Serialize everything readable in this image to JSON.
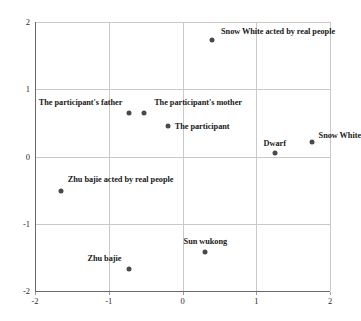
{
  "chart_data": {
    "type": "scatter",
    "title": "",
    "subtitle": "",
    "xlabel": "",
    "ylabel": "",
    "xlim": [
      -2,
      2
    ],
    "ylim": [
      -2,
      2
    ],
    "xticks": [
      "-2",
      "-1",
      "0",
      "1",
      "2"
    ],
    "xtick_values": [
      -2,
      -1,
      0,
      1,
      2
    ],
    "yticks": [
      "2",
      "1",
      "0",
      "-1",
      "-2"
    ],
    "ytick_values": [
      2,
      1,
      0,
      -1,
      -2
    ],
    "grid": true,
    "legend": "none",
    "marker_color": "#4a4a4a",
    "grid_color": "#c9c9c9",
    "axis_color": "#6a6a6a",
    "points": [
      {
        "label": "Snow White acted by real people",
        "x": 0.4,
        "y": 1.73,
        "label_anchor": "left",
        "label_dx": 9,
        "label_dy": -9
      },
      {
        "label": "The participant's father",
        "x": -0.72,
        "y": 0.65,
        "label_anchor": "right",
        "label_dx": -7,
        "label_dy": -11
      },
      {
        "label": "The participant's mother",
        "x": -0.52,
        "y": 0.65,
        "label_anchor": "left",
        "label_dx": 10,
        "label_dy": -11
      },
      {
        "label": "The participant",
        "x": -0.2,
        "y": 0.46,
        "label_anchor": "left",
        "label_dx": 7,
        "label_dy": 0
      },
      {
        "label": "Dwarf",
        "x": 1.25,
        "y": 0.05,
        "label_anchor": "center",
        "label_dx": 0,
        "label_dy": -10
      },
      {
        "label": "Snow White",
        "x": 1.75,
        "y": 0.22,
        "label_anchor": "left",
        "label_dx": 7,
        "label_dy": -7
      },
      {
        "label": "Zhu bajie acted by real people",
        "x": -1.65,
        "y": -0.52,
        "label_anchor": "left",
        "label_dx": 7,
        "label_dy": -12
      },
      {
        "label": "Sun wukong",
        "x": 0.31,
        "y": -1.42,
        "label_anchor": "center",
        "label_dx": 0,
        "label_dy": -11
      },
      {
        "label": "Zhu bajie",
        "x": -0.72,
        "y": -1.68,
        "label_anchor": "right",
        "label_dx": -8,
        "label_dy": -11
      }
    ]
  }
}
